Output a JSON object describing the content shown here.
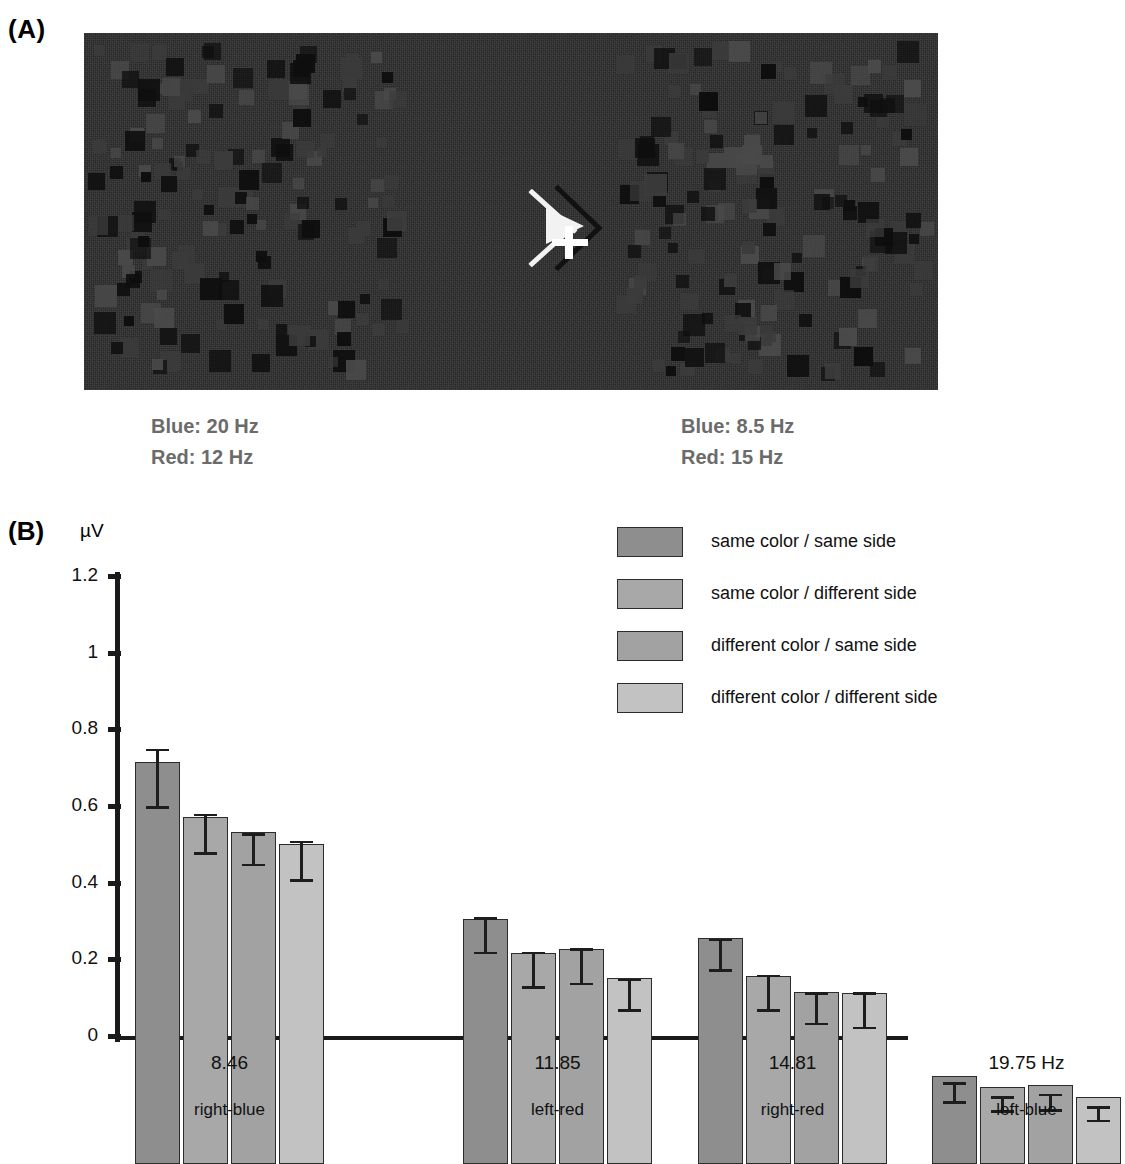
{
  "panels": {
    "a": {
      "label": "(A)"
    },
    "b": {
      "label": "(B)"
    }
  },
  "stimulus": {
    "left_labels": {
      "blue": "Blue: 20 Hz",
      "red": "Red: 12 Hz"
    },
    "right_labels": {
      "blue": "Blue: 8.5 Hz",
      "red": "Red: 15 Hz"
    },
    "fixation_icon": "arrow-plus-fixation-icon",
    "background_color": "#2b2b2b"
  },
  "chart_data": {
    "type": "bar",
    "title": "",
    "xlabel": "",
    "ylabel": "µV",
    "ylim": [
      0,
      1.2
    ],
    "yticks": [
      0,
      0.2,
      0.4,
      0.6,
      0.8,
      1,
      1.2
    ],
    "ytick_labels": [
      "0",
      "0.2",
      "0.4",
      "0.6",
      "0.8",
      "1",
      "1.2"
    ],
    "grid": false,
    "legend_position": "top-right",
    "categories": [
      "8.46",
      "11.85",
      "14.81",
      "19.75 Hz"
    ],
    "category_sublabels": [
      "right-blue",
      "left-red",
      "right-red",
      "left-blue"
    ],
    "series": [
      {
        "name": "same color / same side",
        "color": "#8e8e8e",
        "values": [
          1.05,
          0.64,
          0.59,
          0.23
        ],
        "errors": [
          0.075,
          0.045,
          0.04,
          0.025
        ]
      },
      {
        "name": "same color / different side",
        "color": "#a8a8a8",
        "values": [
          0.905,
          0.55,
          0.49,
          0.2
        ],
        "errors": [
          0.05,
          0.045,
          0.045,
          0.018
        ]
      },
      {
        "name": "different color / same side",
        "color": "#a2a2a2",
        "values": [
          0.865,
          0.56,
          0.45,
          0.205
        ],
        "errors": [
          0.04,
          0.045,
          0.04,
          0.02
        ]
      },
      {
        "name": "different color / different side",
        "color": "#c2c2c2",
        "values": [
          0.835,
          0.485,
          0.445,
          0.175
        ],
        "errors": [
          0.05,
          0.04,
          0.045,
          0.018
        ]
      }
    ]
  }
}
